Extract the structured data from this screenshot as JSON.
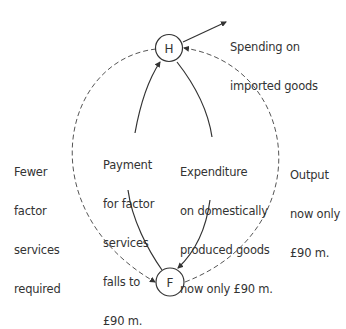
{
  "nodes": {
    "households": {
      "label": "H"
    },
    "firms": {
      "label": "F"
    }
  },
  "labels": {
    "imports": [
      "Spending on",
      "imported goods"
    ],
    "fewer_factor": [
      "Fewer",
      "factor",
      "services",
      "required"
    ],
    "payment": [
      "Payment",
      "for factor",
      "services",
      "falls to",
      "£90 m."
    ],
    "expenditure": [
      "Expenditure",
      "on domestically",
      "produced goods",
      "now only £90 m."
    ],
    "output": [
      "Output",
      "now only",
      "£90 m."
    ]
  },
  "colors": {
    "line": "#333333",
    "dashed": "#555555"
  }
}
